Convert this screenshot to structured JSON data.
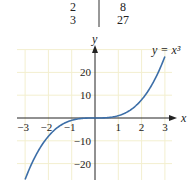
{
  "table": {
    "rows": [
      {
        "x": "2",
        "y": "8"
      },
      {
        "x": "3",
        "y": "27"
      }
    ]
  },
  "chart_data": {
    "type": "line",
    "title": "",
    "equation_label": "y = x³",
    "xlabel": "x",
    "ylabel": "y",
    "xlim": [
      -3,
      3
    ],
    "ylim": [
      -27,
      27
    ],
    "x_ticks": [
      -3,
      -2,
      -1,
      1,
      2,
      3
    ],
    "x_tick_labels": [
      "−3",
      "−2",
      "−1",
      "1",
      "2",
      "3"
    ],
    "y_ticks": [
      -20,
      -10,
      10,
      20
    ],
    "y_tick_labels": [
      "−20",
      "−10",
      "10",
      "20"
    ],
    "grid": true,
    "legend": "none",
    "series": [
      {
        "name": "y = x^3",
        "color": "#3d6fa8",
        "x": [
          -3,
          -2.5,
          -2,
          -1.5,
          -1,
          -0.5,
          0,
          0.5,
          1,
          1.5,
          2,
          2.5,
          3
        ],
        "y": [
          -27,
          -15.625,
          -8,
          -3.375,
          -1,
          -0.125,
          0,
          0.125,
          1,
          3.375,
          8,
          15.625,
          27
        ]
      }
    ]
  }
}
